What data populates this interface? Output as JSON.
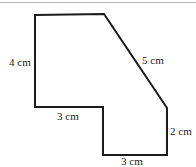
{
  "figure": {
    "background_color": "#ffffff",
    "stroke_color": "#1b1b1b",
    "stroke_width": 2,
    "top_rule_color": "#b9b9b9",
    "shape": {
      "name": "hexagonal-composite-shape",
      "vertices": [
        [
          35,
          15
        ],
        [
          104,
          14
        ],
        [
          167,
          108
        ],
        [
          167,
          155
        ],
        [
          103,
          155
        ],
        [
          103,
          107
        ],
        [
          35,
          107
        ]
      ],
      "points_string": "35,15 104,14 167,108 167,155 103,155 103,107 35,107"
    },
    "labels": [
      {
        "id": "left-side",
        "text": "4 cm",
        "value": 4,
        "unit": "cm",
        "x": 9,
        "y": 57,
        "edge": "left-vertical"
      },
      {
        "id": "diagonal-side",
        "text": "5 cm",
        "value": 5,
        "unit": "cm",
        "x": 142,
        "y": 55,
        "edge": "diagonal"
      },
      {
        "id": "step-side",
        "text": "3 cm",
        "value": 3,
        "unit": "cm",
        "x": 57,
        "y": 111,
        "edge": "middle-horizontal"
      },
      {
        "id": "right-side",
        "text": "2 cm",
        "value": 2,
        "unit": "cm",
        "x": 170,
        "y": 126,
        "edge": "right-vertical"
      },
      {
        "id": "bottom-side",
        "text": "3 cm",
        "value": 3,
        "unit": "cm",
        "x": 121,
        "y": 156,
        "edge": "bottom-horizontal"
      }
    ]
  }
}
